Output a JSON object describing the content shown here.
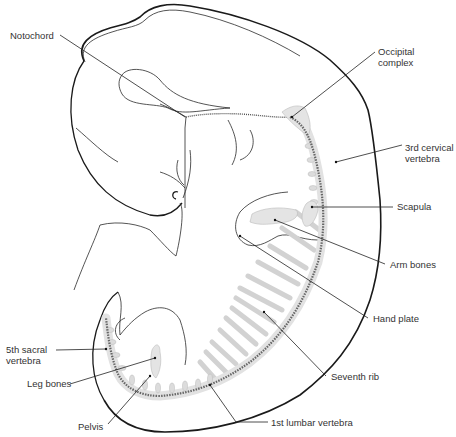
{
  "figure": {
    "labels": [
      {
        "id": "notochord",
        "text": "Notochord",
        "x": 41,
        "y": 29
      },
      {
        "id": "occipital-complex",
        "text": "Occipital\ncomplex",
        "x": 379,
        "y": 45
      },
      {
        "id": "third-cervical-vertebra",
        "text": "3rd cervical\nvertebra",
        "x": 404,
        "y": 142
      },
      {
        "id": "scapula",
        "text": "Scapula",
        "x": 396,
        "y": 203
      },
      {
        "id": "arm-bones",
        "text": "Arm bones",
        "x": 389,
        "y": 258
      },
      {
        "id": "hand-plate",
        "text": "Hand plate",
        "x": 372,
        "y": 312
      },
      {
        "id": "seventh-rib",
        "text": "Seventh rib",
        "x": 330,
        "y": 369
      },
      {
        "id": "first-lumbar-vertebra",
        "text": "1st lumbar vertebra",
        "x": 270,
        "y": 416
      },
      {
        "id": "fifth-sacral-vertebra",
        "text": "5th sacral\nvertebra",
        "x": 6,
        "y": 347
      },
      {
        "id": "leg-bones",
        "text": "Leg bones",
        "x": 27,
        "y": 380
      },
      {
        "id": "pelvis",
        "text": "Pelvis",
        "x": 78,
        "y": 423
      }
    ]
  },
  "labels": {
    "notochord": "Notochord",
    "occipital_line1": "Occipital",
    "occipital_line2": "complex",
    "cervical_line1": "3rd cervical",
    "cervical_line2": "vertebra",
    "scapula": "Scapula",
    "arm_bones": "Arm bones",
    "hand_plate": "Hand plate",
    "seventh_rib": "Seventh rib",
    "first_lumbar": "1st lumbar vertebra",
    "sacral_line1": "5th sacral",
    "sacral_line2": "vertebra",
    "leg_bones": "Leg bones",
    "pelvis": "Pelvis"
  }
}
